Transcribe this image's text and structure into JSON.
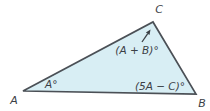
{
  "figure": {
    "vertex_labels": {
      "A": "A",
      "B": "B",
      "C": "C"
    },
    "angle_labels": {
      "at_A": "A°",
      "at_B": "(5A − C)°",
      "at_C": "(A + B)°"
    },
    "colors": {
      "background": "#ffffff",
      "triangle_fill": "#d8eef4",
      "triangle_stroke": "#4b5056",
      "label_text": "#3b4046",
      "arrow": "#3b4046"
    },
    "geometry": {
      "triangle_points": "23,91 153,22 196,94",
      "arrow_tail": "142,42",
      "arrow_tip": "150.5,29.5"
    }
  }
}
